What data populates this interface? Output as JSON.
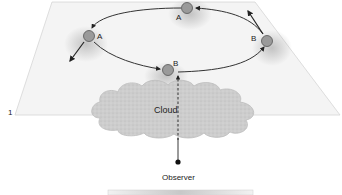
{
  "figure": {
    "number_label": "1",
    "cloud_label": "Cloud",
    "observer_label": "Observer",
    "colors": {
      "plane_fill": "#f4f4f4",
      "plane_edge": "#d8d8d8",
      "body_fill": "#9a9a9a",
      "body_stroke": "#555555",
      "orbit": "#333333",
      "cloud_fill": "#cfcfcf",
      "cloud_stroke": "#bdbdbd",
      "observer_dot": "#111111"
    },
    "bodies": [
      {
        "id": "top",
        "label": "A",
        "cx": 187,
        "cy": 8,
        "label_x": 176,
        "label_y": 18
      },
      {
        "id": "left",
        "label": "A",
        "cx": 89,
        "cy": 36,
        "label_x": 98,
        "label_y": 39
      },
      {
        "id": "right",
        "label": "B",
        "cx": 267,
        "cy": 41,
        "label_x": 252,
        "label_y": 40
      },
      {
        "id": "front",
        "label": "B",
        "cx": 168,
        "cy": 70,
        "label_x": 174,
        "label_y": 66
      }
    ]
  }
}
